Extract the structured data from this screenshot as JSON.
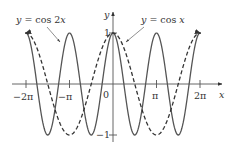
{
  "chart_data": {
    "type": "line",
    "title": "",
    "xlabel": "x",
    "ylabel": "y",
    "xlim": [
      -6.5,
      6.5
    ],
    "ylim": [
      -1,
      1
    ],
    "grid": false,
    "legend": "annotations with leader arrows",
    "x_ticks": [
      {
        "value": -6.2832,
        "label": "−2π"
      },
      {
        "value": -3.1416,
        "label": "−π"
      },
      {
        "value": 0,
        "label": "0"
      },
      {
        "value": 3.1416,
        "label": "π"
      },
      {
        "value": 6.2832,
        "label": "2π"
      }
    ],
    "y_ticks": [
      {
        "value": 1,
        "label": "1"
      },
      {
        "value": -1,
        "label": "−1"
      }
    ],
    "series": [
      {
        "name": "y = cos 2x",
        "function": "cos(2x)",
        "style": "solid",
        "domain": [
          -6.33,
          6.33
        ],
        "x": [
          -6.2832,
          -4.7124,
          -3.1416,
          -1.5708,
          0,
          1.5708,
          3.1416,
          4.7124,
          6.2832
        ],
        "values": [
          1,
          -1,
          1,
          -1,
          1,
          -1,
          1,
          -1,
          1
        ]
      },
      {
        "name": "y = cos x",
        "function": "cos(x)",
        "style": "dashed",
        "domain": [
          -6.33,
          6.33
        ],
        "x": [
          -6.2832,
          -3.1416,
          0,
          3.1416,
          6.2832
        ],
        "values": [
          1,
          -1,
          1,
          -1,
          1
        ]
      }
    ],
    "annotations": [
      {
        "text": "y = cos 2x",
        "points_to": "cos 2x curve near x ≈ −3π/2"
      },
      {
        "text": "y = cos x",
        "points_to": "cos x curve near x ≈ 0.3"
      }
    ]
  },
  "labels": {
    "x_axis": "x",
    "y_axis": "y",
    "tick_neg_2pi": "−2π",
    "tick_neg_pi": "−π",
    "tick_zero": "0",
    "tick_pi": "π",
    "tick_2pi": "2π",
    "tick_one": "1",
    "tick_neg_one": "−1",
    "annot_cos2x_y": "y",
    "annot_cos2x_rest": " = cos 2",
    "annot_cos2x_x": "x",
    "annot_cosx_y": "y",
    "annot_cosx_rest": " = cos ",
    "annot_cosx_x": "x"
  }
}
